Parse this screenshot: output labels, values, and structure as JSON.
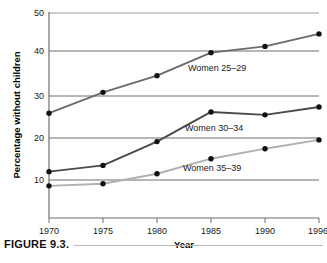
{
  "figure": {
    "caption": "FIGURE 9.3."
  },
  "chart_data": {
    "type": "line",
    "title": "",
    "xlabel": "Year",
    "ylabel": "Percentage without children",
    "x": [
      1970,
      1975,
      1980,
      1985,
      1990,
      1996
    ],
    "xtick_labels": [
      "1970",
      "1975",
      "1980",
      "1985",
      "1990",
      "1996"
    ],
    "ytick_labels": [
      "10",
      "20",
      "30",
      "40",
      "50"
    ],
    "yticks": [
      10,
      20,
      30,
      40,
      50
    ],
    "ylim": [
      0,
      50
    ],
    "xlim": [
      1970,
      1996
    ],
    "grid": "horizontal",
    "legend_position": "inline-annotations",
    "markers": "filled-circle",
    "series": [
      {
        "name": "Women 25–29",
        "label": "Women 25–29",
        "color": "#6b6b6b",
        "marker_color": "#111111",
        "values": [
          26.0,
          31.0,
          35.0,
          40.5,
          42.0,
          45.0
        ],
        "label_x": 1983.0,
        "label_y": 36.5
      },
      {
        "name": "Women 30–34",
        "label": "Women 30–34",
        "color": "#4a4a4a",
        "marker_color": "#111111",
        "values": [
          12.0,
          13.5,
          19.2,
          26.3,
          25.6,
          27.5
        ],
        "label_x": 1983.0,
        "label_y": 22.3
      },
      {
        "name": "Women 35–39",
        "label": "Women 35–39",
        "color": "#b0b0b0",
        "marker_color": "#111111",
        "values": [
          8.6,
          9.1,
          11.5,
          15.1,
          17.5,
          19.6
        ],
        "label_x": 1983.0,
        "label_y": 12.9
      }
    ]
  }
}
